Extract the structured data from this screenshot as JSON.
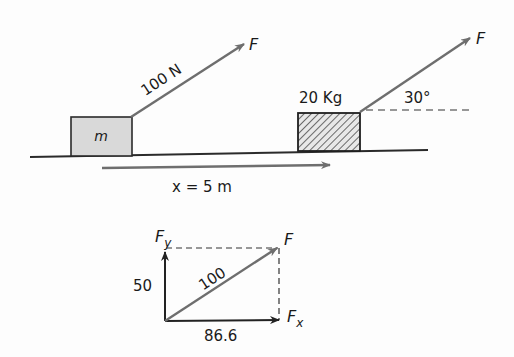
{
  "diagram": {
    "title": "",
    "scene": {
      "block_left": {
        "label": "m",
        "fill": "#d9d9d9"
      },
      "force_left": {
        "magnitude_label": "100 N",
        "name_label": "F"
      },
      "block_right": {
        "mass_label": "20 Kg",
        "pattern": "hatched"
      },
      "force_right": {
        "name_label": "F",
        "angle_label": "30°"
      },
      "displacement": {
        "label": "x = 5 m"
      }
    },
    "vector_decomposition": {
      "fy_label": "F",
      "fy_sub": "y",
      "fx_label": "F",
      "fx_sub": "x",
      "f_label": "F",
      "fy_value": "50",
      "f_value": "100",
      "fx_value": "86.6"
    },
    "colors": {
      "arrow_gray": "#6e6e6e",
      "line_dark": "#2a2a2a",
      "block_fill": "#d9d9d9"
    }
  }
}
